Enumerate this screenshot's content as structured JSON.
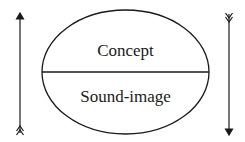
{
  "diagram": {
    "top_label": "Concept",
    "bottom_label": "Sound-image",
    "left_arrow": {
      "direction": "up"
    },
    "right_arrow": {
      "direction": "down"
    },
    "stroke_color": "#1a1a1a"
  }
}
